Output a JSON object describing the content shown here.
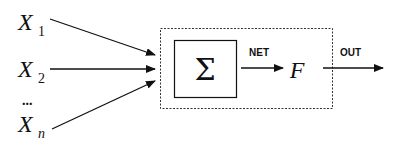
{
  "diagram": {
    "inputs": [
      {
        "symbol": "X",
        "subscript": "1"
      },
      {
        "symbol": "X",
        "subscript": "2"
      },
      {
        "symbol": "X",
        "subscript": "n"
      }
    ],
    "ellipsis": "...",
    "summation_symbol": "Σ",
    "net_label": "NET",
    "activation_symbol": "F",
    "out_label": "OUT"
  }
}
